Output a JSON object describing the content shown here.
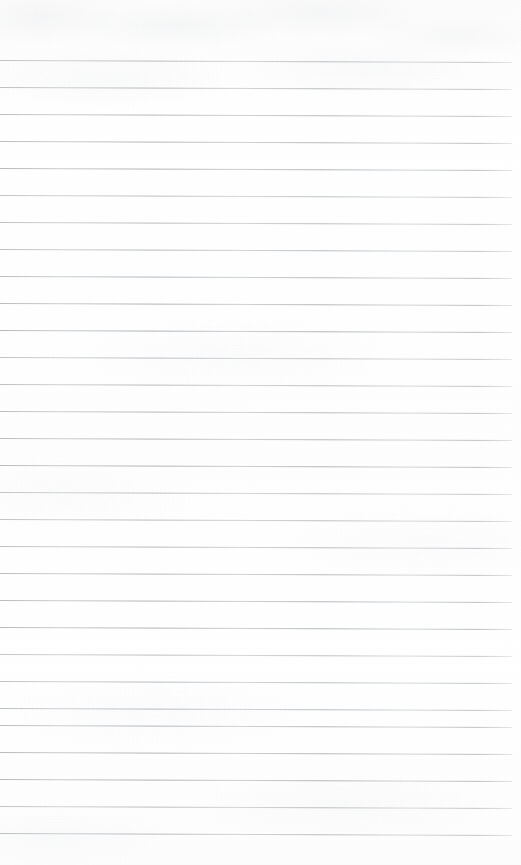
{
  "document": {
    "kind": "scanned-blank-lined-paper",
    "page_width": 521,
    "page_height": 865,
    "background_color": "#fefefe",
    "paper_tone": "#fdfdfd",
    "has_visible_text": false,
    "has_handwriting": false,
    "has_header": false,
    "has_footer": false,
    "has_page_number": false
  },
  "ruling": {
    "line_color": "#9b9ea3",
    "line_thickness_px": 1,
    "line_count": 30,
    "first_line_y": 60,
    "line_spacing_px": 27,
    "line_start_x": 0,
    "line_end_x": 512,
    "line_length_px": 512,
    "skew_degrees": 0.22,
    "rule_style": "wide-ruled-horizontal",
    "has_left_margin_rule": false,
    "has_right_margin_rule": false
  },
  "margins": {
    "top_margin_px": 60,
    "bottom_margin_px": 32,
    "left_margin_px": 0,
    "right_margin_px": 9
  },
  "lines": [
    {
      "index": 1,
      "y": 60,
      "content": ""
    },
    {
      "index": 2,
      "y": 87,
      "content": ""
    },
    {
      "index": 3,
      "y": 114,
      "content": ""
    },
    {
      "index": 4,
      "y": 141,
      "content": ""
    },
    {
      "index": 5,
      "y": 168,
      "content": ""
    },
    {
      "index": 6,
      "y": 195,
      "content": ""
    },
    {
      "index": 7,
      "y": 222,
      "content": ""
    },
    {
      "index": 8,
      "y": 249,
      "content": ""
    },
    {
      "index": 9,
      "y": 276,
      "content": ""
    },
    {
      "index": 10,
      "y": 303,
      "content": ""
    },
    {
      "index": 11,
      "y": 330,
      "content": ""
    },
    {
      "index": 12,
      "y": 357,
      "content": ""
    },
    {
      "index": 13,
      "y": 384,
      "content": ""
    },
    {
      "index": 14,
      "y": 411,
      "content": ""
    },
    {
      "index": 15,
      "y": 438,
      "content": ""
    },
    {
      "index": 16,
      "y": 465,
      "content": ""
    },
    {
      "index": 17,
      "y": 492,
      "content": ""
    },
    {
      "index": 18,
      "y": 519,
      "content": ""
    },
    {
      "index": 19,
      "y": 546,
      "content": ""
    },
    {
      "index": 20,
      "y": 573,
      "content": ""
    },
    {
      "index": 21,
      "y": 600,
      "content": ""
    },
    {
      "index": 22,
      "y": 627,
      "content": ""
    },
    {
      "index": 23,
      "y": 654,
      "content": ""
    },
    {
      "index": 24,
      "y": 681,
      "content": ""
    },
    {
      "index": 25,
      "y": 708,
      "content": ""
    },
    {
      "index": 26,
      "y": 725,
      "content": ""
    },
    {
      "index": 27,
      "y": 752,
      "content": ""
    },
    {
      "index": 28,
      "y": 779,
      "content": ""
    },
    {
      "index": 29,
      "y": 806,
      "content": ""
    },
    {
      "index": 30,
      "y": 833,
      "content": ""
    }
  ]
}
